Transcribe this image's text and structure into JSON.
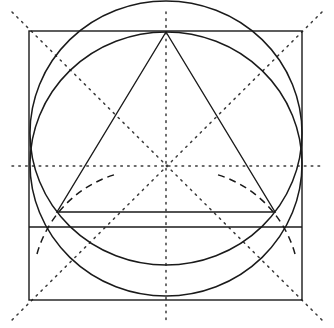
{
  "figure": {
    "type": "geometric-construction",
    "canvas": {
      "width": 334,
      "height": 328,
      "background": "#ffffff"
    },
    "colors": {
      "stroke_solid": "#1a1a1a",
      "stroke_dotted": "#3a3a3a",
      "stroke_dashed": "#1a1a1a",
      "background": "#ffffff"
    },
    "stroke_widths": {
      "square": 1.4,
      "circle": 1.5,
      "triangle": 1.4,
      "chord": 1.4,
      "dotted": 1.5,
      "dashed": 1.5
    }
  },
  "geometry": {
    "center": {
      "x": 166,
      "y": 166,
      "label": "center"
    },
    "square": {
      "name": "bounding-square",
      "left": 29,
      "top": 31,
      "right": 302,
      "bottom": 300,
      "width": 273,
      "height": 269,
      "corners": [
        {
          "x": 29,
          "y": 31,
          "label": "top-left"
        },
        {
          "x": 302,
          "y": 31,
          "label": "top-right"
        },
        {
          "x": 302,
          "y": 300,
          "label": "bottom-right"
        },
        {
          "x": 29,
          "y": 300,
          "label": "bottom-left"
        }
      ]
    },
    "main_circle": {
      "name": "inscribed-circle",
      "cx": 166,
      "cy": 164,
      "rx": 136,
      "ry": 132,
      "top_y": 32,
      "bottom_y": 296
    },
    "second_circle": {
      "name": "lower-circle",
      "cx": 166,
      "cy": 133,
      "rx": 136,
      "ry": 132,
      "top_y": 31,
      "bottom_y": 265
    },
    "triangle": {
      "name": "inscribed-triangle",
      "apex": {
        "x": 166,
        "y": 32
      },
      "left_vertex": {
        "x": 57,
        "y": 212
      },
      "right_vertex": {
        "x": 275,
        "y": 212
      }
    },
    "chord": {
      "name": "horizontal-chord",
      "x1": 29,
      "x2": 302,
      "y": 227
    },
    "dotted_axes": {
      "horizontal": {
        "x1": 12,
        "x2": 322,
        "y": 166
      },
      "vertical": {
        "x": 166,
        "y1": 12,
        "y2": 320
      },
      "diagonal_nw_se": {
        "x1": 12,
        "y1": 12,
        "x2": 322,
        "y2": 320
      },
      "diagonal_ne_sw": {
        "x1": 322,
        "y1": 12,
        "x2": 12,
        "y2": 320
      }
    },
    "dashed_arcs": [
      {
        "name": "left-compass-arc",
        "start": {
          "x": 37,
          "y": 254
        },
        "end": {
          "x": 117,
          "y": 174
        },
        "radius": 115,
        "sweep": 1
      },
      {
        "name": "right-compass-arc",
        "start": {
          "x": 295,
          "y": 254
        },
        "end": {
          "x": 215,
          "y": 174
        },
        "radius": 115,
        "sweep": 0
      }
    ]
  }
}
